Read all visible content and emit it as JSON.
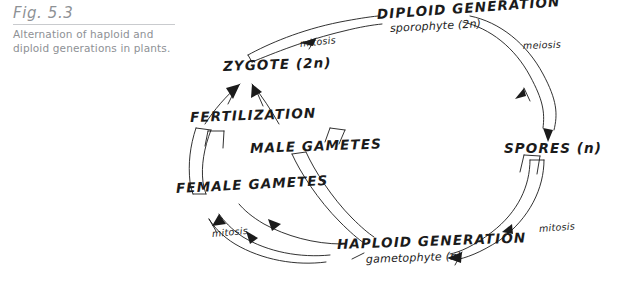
{
  "figure": {
    "number_label": "Fig. 5.3",
    "caption": "Alternation of haploid and diploid generations in plants.",
    "caption_color": "#8e9195",
    "ink_color": "#1b1b1b",
    "background": "#ffffff"
  },
  "diagram": {
    "title_implied": "Alternation of generations life cycle",
    "stages": [
      {
        "id": "diploid-generation",
        "name": "DIPLOID GENERATION",
        "subtitle": "sporophyte (2n)",
        "ploidy": "2n",
        "position": "top-center"
      },
      {
        "id": "spores",
        "name": "SPORES",
        "ploidy_suffix": "(n)",
        "full": "SPORES (n)",
        "position": "right"
      },
      {
        "id": "haploid-generation",
        "name": "HAPLOID GENERATION",
        "subtitle": "gametophyte (n)",
        "ploidy": "n",
        "position": "bottom-center"
      },
      {
        "id": "female-gametes",
        "name": "FEMALE GAMETES",
        "position": "left"
      },
      {
        "id": "male-gametes",
        "name": "MALE GAMETES",
        "position": "center-left"
      },
      {
        "id": "fertilization",
        "name": "FERTILIZATION",
        "position": "upper-left"
      },
      {
        "id": "zygote",
        "name": "ZYGOTE",
        "ploidy_suffix": "(2n)",
        "full": "ZYGOTE (2n)",
        "position": "top-left"
      }
    ],
    "processes": [
      {
        "id": "mitosis-zygote-to-diploid",
        "name": "mitosis",
        "from": "ZYGOTE (2n)",
        "to": "DIPLOID GENERATION"
      },
      {
        "id": "meiosis-diploid-to-spores",
        "name": "meiosis",
        "from": "DIPLOID GENERATION",
        "to": "SPORES (n)"
      },
      {
        "id": "mitosis-spores-to-haploid",
        "name": "mitosis",
        "from": "SPORES (n)",
        "to": "HAPLOID GENERATION"
      },
      {
        "id": "mitosis-haploid-to-gametes",
        "name": "mitosis",
        "from": "HAPLOID GENERATION",
        "to": "GAMETES"
      }
    ]
  }
}
